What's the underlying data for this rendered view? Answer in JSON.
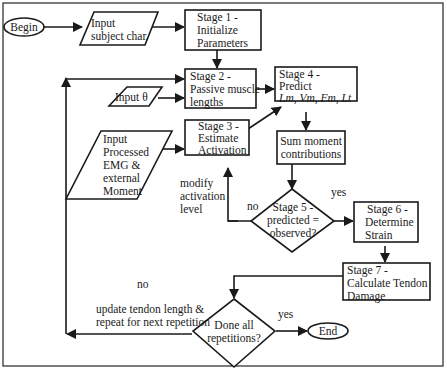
{
  "diagram": {
    "type": "flowchart",
    "nodes": {
      "begin": {
        "shape": "ellipse",
        "label": "Begin"
      },
      "input_subject": {
        "shape": "parallelogram",
        "lines": [
          "Input",
          "subject char."
        ]
      },
      "stage1": {
        "shape": "rect",
        "lines": [
          "Stage 1 -",
          "Initialize",
          "Parameters"
        ]
      },
      "stage2": {
        "shape": "rect",
        "lines": [
          "Stage 2 -",
          "Passive muscle",
          "lengths"
        ]
      },
      "input_theta": {
        "shape": "parallelogram",
        "lines": [
          "Input θ"
        ]
      },
      "input_emg": {
        "shape": "parallelogram",
        "lines": [
          "Input",
          "Processed",
          "EMG &",
          "external",
          "Moment"
        ]
      },
      "stage3": {
        "shape": "rect",
        "lines": [
          "Stage 3 -",
          "Estimate",
          "Activation"
        ]
      },
      "stage4": {
        "shape": "rect",
        "lines": [
          "Stage 4 -",
          "Predict",
          "Lm,  Vm,  Fm,  Lt"
        ]
      },
      "sum_moment": {
        "shape": "rect",
        "lines": [
          "Sum moment",
          "contributions"
        ]
      },
      "stage5": {
        "shape": "diamond",
        "lines": [
          "Stage 5 -",
          "predicted =",
          "observed?"
        ]
      },
      "stage6": {
        "shape": "rect",
        "lines": [
          "Stage 6 -",
          "Determine",
          "Strain"
        ]
      },
      "stage7": {
        "shape": "rect",
        "lines": [
          "Stage 7 -",
          "Calculate Tendon",
          "Damage"
        ]
      },
      "done_all": {
        "shape": "diamond",
        "lines": [
          "Done all",
          "repetitions?"
        ]
      },
      "end": {
        "shape": "ellipse",
        "label": "End"
      }
    },
    "edge_labels": {
      "modify": [
        "modify",
        "activation",
        "level"
      ],
      "stage5_no": "no",
      "stage5_yes": "yes",
      "done_no": "no",
      "update": [
        "update tendon length &",
        "repeat for next repetition"
      ],
      "done_yes": "yes"
    },
    "edges": [
      [
        "begin",
        "input_subject"
      ],
      [
        "input_subject",
        "stage1"
      ],
      [
        "stage1",
        "stage2"
      ],
      [
        "input_theta",
        "stage2"
      ],
      [
        "stage2",
        "stage4"
      ],
      [
        "input_emg",
        "stage3"
      ],
      [
        "stage3",
        "stage4"
      ],
      [
        "stage4",
        "sum_moment"
      ],
      [
        "sum_moment",
        "stage5"
      ],
      [
        "stage5",
        "stage6",
        "yes"
      ],
      [
        "stage5",
        "stage3",
        "no"
      ],
      [
        "stage6",
        "stage7"
      ],
      [
        "stage7",
        "done_all"
      ],
      [
        "done_all",
        "end",
        "yes"
      ],
      [
        "done_all",
        "stage2",
        "no"
      ]
    ]
  }
}
